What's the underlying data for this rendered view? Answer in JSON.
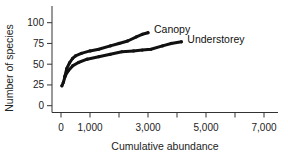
{
  "chart_data": {
    "type": "line",
    "title": "",
    "xlabel": "Cumulative abundance",
    "ylabel": "Number of species",
    "xlim": [
      -200,
      7400
    ],
    "ylim": [
      -8,
      112
    ],
    "x_ticks": [
      0,
      1000,
      2000,
      3000,
      4000,
      5000,
      6000,
      7000
    ],
    "x_tick_labels": [
      "0",
      "1,000",
      "",
      "3,000",
      "",
      "5,000",
      "",
      "7,000"
    ],
    "y_ticks": [
      0,
      25,
      50,
      75,
      100
    ],
    "y_tick_labels": [
      "0",
      "25",
      "50",
      "75",
      "100"
    ],
    "grid": false,
    "legend": "inline labels at curve ends",
    "series": [
      {
        "name": "Canopy",
        "color": "#111111",
        "points": [
          [
            130,
            35
          ],
          [
            200,
            45
          ],
          [
            300,
            52
          ],
          [
            400,
            57
          ],
          [
            500,
            60
          ],
          [
            700,
            63
          ],
          [
            1000,
            66
          ],
          [
            1300,
            68
          ],
          [
            1700,
            72
          ],
          [
            2000,
            75
          ],
          [
            2300,
            78
          ],
          [
            2600,
            83
          ],
          [
            2800,
            86
          ],
          [
            3000,
            88
          ]
        ]
      },
      {
        "name": "Understorey",
        "color": "#111111",
        "points": [
          [
            30,
            24
          ],
          [
            80,
            28
          ],
          [
            150,
            36
          ],
          [
            250,
            42
          ],
          [
            400,
            48
          ],
          [
            600,
            52
          ],
          [
            900,
            56
          ],
          [
            1300,
            59
          ],
          [
            1700,
            62
          ],
          [
            2100,
            65
          ],
          [
            2500,
            66
          ],
          [
            2800,
            67
          ],
          [
            3100,
            68
          ],
          [
            3500,
            72
          ],
          [
            3800,
            75
          ],
          [
            4150,
            77
          ]
        ]
      }
    ]
  }
}
